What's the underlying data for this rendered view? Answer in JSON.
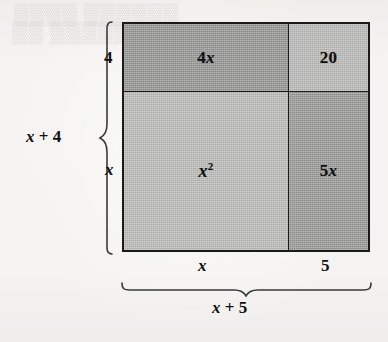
{
  "diagram": {
    "type": "area-model",
    "cells": [
      {
        "id": "top-left",
        "label_html": "4<i class=\"var\">x</i>",
        "plain": "4x",
        "fill": "#979796"
      },
      {
        "id": "top-right",
        "label_html": "20",
        "plain": "20",
        "fill": "#bbbbb9"
      },
      {
        "id": "bottom-left",
        "label_html": "<i class=\"var\">x</i><sup>2</sup>",
        "plain": "x^2",
        "fill": "#bcbcba"
      },
      {
        "id": "bottom-right",
        "label_html": "5<i class=\"var\">x</i>",
        "plain": "5x",
        "fill": "#9a9a99"
      }
    ],
    "left_brace": {
      "total_label_html": "<i class=\"var\">x</i> + 4",
      "total_plain": "x + 4",
      "segments": [
        {
          "label": "4",
          "plain": "4"
        },
        {
          "label": "x",
          "plain": "x"
        }
      ]
    },
    "bottom_brace": {
      "total_label_html": "<i class=\"var\">x</i> + 5",
      "total_plain": "x + 5",
      "segments": [
        {
          "label": "x",
          "plain": "x"
        },
        {
          "label": "5",
          "plain": "5"
        }
      ]
    },
    "bleed_through": {
      "line1": "▒▒▒▒  ▒▒▒▒▒▒",
      "line2": "▒▒ ▒▒▒▒▒▒  ▒▒▒▒▒"
    },
    "colors": {
      "page_background": "#f4f3f1",
      "stroke": "#1a1a1a",
      "dark_fill": "#979796",
      "light_fill": "#bcbcba",
      "text": "#111111"
    }
  }
}
